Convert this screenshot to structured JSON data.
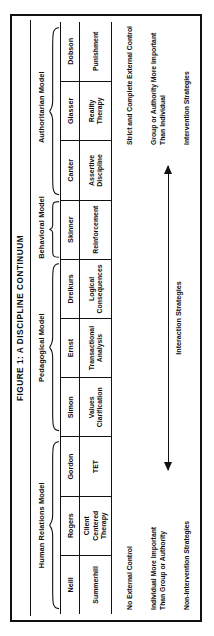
{
  "figure": {
    "title": "FIGURE 1:  A DISCIPLINE CONTINUUM",
    "orientation": "rotated-90-ccw"
  },
  "models": [
    {
      "label": "Human Relations Model",
      "span": 3
    },
    {
      "label": "Pedagogical Model",
      "span": 3
    },
    {
      "label": "Behavioral Model",
      "span": 1
    },
    {
      "label": "Authoritarian Model",
      "span": 3
    }
  ],
  "columns": [
    {
      "group": 0,
      "name": "Neill",
      "approach_line1": "Summerhill",
      "approach_line2": "",
      "approach_line3": ""
    },
    {
      "group": 0,
      "name": "Rogers",
      "approach_line1": "Client",
      "approach_line2": "Centered",
      "approach_line3": "Therapy"
    },
    {
      "group": 0,
      "name": "Gordon",
      "approach_line1": "TET",
      "approach_line2": "",
      "approach_line3": ""
    },
    {
      "group": 1,
      "name": "Simon",
      "approach_line1": "Values",
      "approach_line2": "Clarification",
      "approach_line3": ""
    },
    {
      "group": 1,
      "name": "Ernst",
      "approach_line1": "Transactional",
      "approach_line2": "Analysis",
      "approach_line3": ""
    },
    {
      "group": 1,
      "name": "Dreikurs",
      "approach_line1": "Logical",
      "approach_line2": "Consequences",
      "approach_line3": ""
    },
    {
      "group": 2,
      "name": "Skinner",
      "approach_line1": "Reinforcement",
      "approach_line2": "",
      "approach_line3": ""
    },
    {
      "group": 3,
      "name": "Canter",
      "approach_line1": "Assertive",
      "approach_line2": "Discipline",
      "approach_line3": ""
    },
    {
      "group": 3,
      "name": "Glasser",
      "approach_line1": "Reality",
      "approach_line2": "Therapy",
      "approach_line3": ""
    },
    {
      "group": 3,
      "name": "Dobson",
      "approach_line1": "Punishment",
      "approach_line2": "",
      "approach_line3": ""
    }
  ],
  "left_description": {
    "line1": "No External Control",
    "line2": "Individual More Important\nThan Group or Authority",
    "line3": "Non-Intervention Strategies"
  },
  "right_description": {
    "line1": "Strict and Complete External Control",
    "line2": "Group or Authority More Important\nThan Individual",
    "line3": "Intervention Strategies"
  },
  "arrow": {
    "label": "Interaction Strategies",
    "direction": "double"
  },
  "colors": {
    "ink": "#111111",
    "paper": "#ffffff"
  }
}
